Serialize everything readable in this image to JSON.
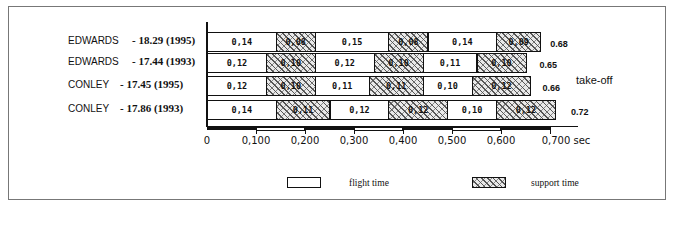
{
  "chart_data": {
    "type": "bar",
    "subtype": "stacked-horizontal-timeline",
    "title": "",
    "xlabel": "sec",
    "ylabel": "",
    "xlim": [
      0,
      0.7
    ],
    "x_ticks": [
      "0",
      "0,100",
      "0,200",
      "0,300",
      "0,400",
      "0,500",
      "0,600",
      "0,700 sec"
    ],
    "categories": [
      "EDWARDS - 18.29 (1995)",
      "EDWARDS - 17.44 (1993)",
      "CONLEY - 17.45 (1995)",
      "CONLEY - 17.86 (1993)"
    ],
    "rows": [
      {
        "athlete": "EDWARDS",
        "result": "- 18.29 (1995)",
        "segments": [
          {
            "type": "flight",
            "value": 0.14,
            "label": "0,14"
          },
          {
            "type": "support",
            "value": 0.08,
            "label": "0,08"
          },
          {
            "type": "flight",
            "value": 0.15,
            "label": "0,15"
          },
          {
            "type": "support",
            "value": 0.08,
            "label": "0,08"
          },
          {
            "type": "flight",
            "value": 0.14,
            "label": "0,14"
          },
          {
            "type": "support",
            "value": 0.09,
            "label": "0,09"
          }
        ],
        "total": "0.68"
      },
      {
        "athlete": "EDWARDS",
        "result": "- 17.44 (1993)",
        "segments": [
          {
            "type": "flight",
            "value": 0.12,
            "label": "0,12"
          },
          {
            "type": "support",
            "value": 0.1,
            "label": "0,10"
          },
          {
            "type": "flight",
            "value": 0.12,
            "label": "0,12"
          },
          {
            "type": "support",
            "value": 0.1,
            "label": "0,10"
          },
          {
            "type": "flight",
            "value": 0.11,
            "label": "0,11"
          },
          {
            "type": "support",
            "value": 0.1,
            "label": "0,10"
          }
        ],
        "total": "0.65"
      },
      {
        "athlete": "CONLEY",
        "result": "- 17.45 (1995)",
        "segments": [
          {
            "type": "flight",
            "value": 0.12,
            "label": "0,12"
          },
          {
            "type": "support",
            "value": 0.1,
            "label": "0,10"
          },
          {
            "type": "flight",
            "value": 0.11,
            "label": "0,11"
          },
          {
            "type": "support",
            "value": 0.11,
            "label": "0,11"
          },
          {
            "type": "flight",
            "value": 0.1,
            "label": "0,10"
          },
          {
            "type": "support",
            "value": 0.12,
            "label": "0,12"
          }
        ],
        "total": "0.66"
      },
      {
        "athlete": "CONLEY",
        "result": "- 17.86 (1993)",
        "segments": [
          {
            "type": "flight",
            "value": 0.14,
            "label": "0,14"
          },
          {
            "type": "support",
            "value": 0.11,
            "label": "0,11"
          },
          {
            "type": "flight",
            "value": 0.12,
            "label": "0,12"
          },
          {
            "type": "support",
            "value": 0.12,
            "label": "0,12"
          },
          {
            "type": "flight",
            "value": 0.1,
            "label": "0,10"
          },
          {
            "type": "support",
            "value": 0.12,
            "label": "0,12"
          }
        ],
        "total": "0.72"
      }
    ],
    "series": [
      {
        "name": "flight time",
        "values": [
          [
            0.14,
            0.15,
            0.14
          ],
          [
            0.12,
            0.12,
            0.11
          ],
          [
            0.12,
            0.11,
            0.1
          ],
          [
            0.14,
            0.12,
            0.1
          ]
        ]
      },
      {
        "name": "support time",
        "values": [
          [
            0.08,
            0.08,
            0.09
          ],
          [
            0.1,
            0.1,
            0.1
          ],
          [
            0.1,
            0.11,
            0.12
          ],
          [
            0.11,
            0.12,
            0.12
          ]
        ]
      }
    ],
    "totals": [
      0.68,
      0.65,
      0.66,
      0.72
    ],
    "annotations": [
      "take-off"
    ],
    "legend": [
      "flight time",
      "support time"
    ],
    "legend_position": "bottom",
    "grid": false
  },
  "annotation": {
    "takeoff": "take-off"
  },
  "legend": {
    "flight": "flight time",
    "support": "support time"
  }
}
